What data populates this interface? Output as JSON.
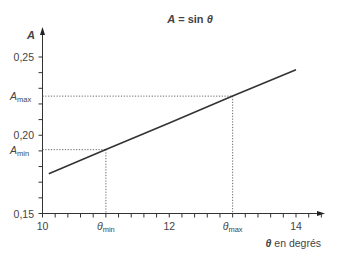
{
  "chart_data": {
    "type": "line",
    "title": "A = sin θ",
    "title_parts": {
      "var": "A",
      "eq": " = sin ",
      "theta": "θ"
    },
    "xlabel": "θ en degrés",
    "xlabel_parts": {
      "theta": "θ",
      "rest": " en degrés"
    },
    "ylabel": "A",
    "xlim": [
      10,
      14.6
    ],
    "ylim": [
      0.15,
      0.26
    ],
    "x_ticks": [
      {
        "value": 10,
        "label": "10"
      },
      {
        "value": 12,
        "label": "12"
      },
      {
        "value": 14,
        "label": "14"
      }
    ],
    "x_minor_step": 0.2,
    "y_ticks": [
      {
        "value": 0.15,
        "label": "0,15"
      },
      {
        "value": 0.2,
        "label": "0,20"
      },
      {
        "value": 0.25,
        "label": "0,25"
      }
    ],
    "y_minor_step": 0.01,
    "grid": false,
    "series": [
      {
        "name": "A = sin θ",
        "x": [
          10.1,
          11.0,
          12.0,
          13.0,
          14.0
        ],
        "y": [
          0.1754,
          0.1908,
          0.2079,
          0.225,
          0.2419
        ]
      }
    ],
    "annotations": [
      {
        "type": "guide",
        "x": 11.0,
        "y": 0.1908,
        "x_label": {
          "main": "θ",
          "sub": "min"
        },
        "y_label": {
          "main": "A",
          "sub": "min"
        }
      },
      {
        "type": "guide",
        "x": 13.0,
        "y": 0.225,
        "x_label": {
          "main": "θ",
          "sub": "max"
        },
        "y_label": {
          "main": "A",
          "sub": "max"
        }
      }
    ]
  }
}
